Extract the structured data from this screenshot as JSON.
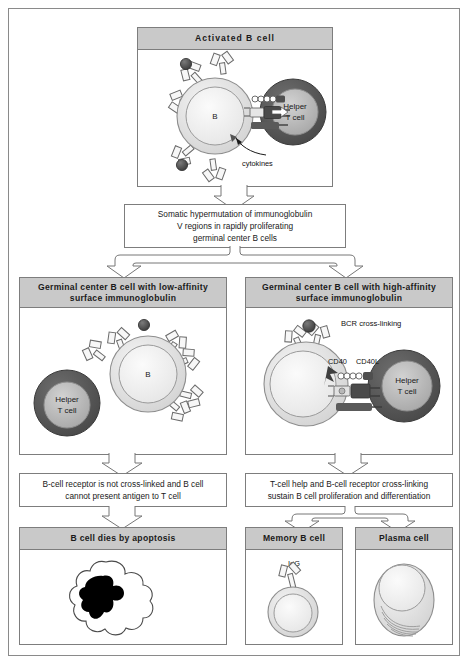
{
  "figure": {
    "colors": {
      "header_fill": "#c9c9c9",
      "border": "#7d7d7d",
      "bcell_fill": "#d8d8d8",
      "bcell_nucleus": "#ececec",
      "tcell_rim": "#5a5a5a",
      "tcell_nucleus": "#b4b4b4",
      "antigen": "#4a4a4a",
      "background": "#ffffff"
    }
  },
  "top_panel": {
    "header": "Activated B cell",
    "bcell_label": "B",
    "tcell_label_line1": "Helper",
    "tcell_label_line2": "T cell",
    "cytokines_label": "cytokines"
  },
  "middle_box": {
    "line1": "Somatic hypermutation of immunoglobulin",
    "line2": "V regions in rapidly proliferating",
    "line3": "germinal center B cells"
  },
  "left_branch": {
    "header_line1": "Germinal center B cell with low-affinity",
    "header_line2": "surface immunoglobulin",
    "bcell_label": "B",
    "tcell_label_line1": "Helper",
    "tcell_label_line2": "T cell",
    "outcome_line1": "B-cell receptor is not cross-linked and B cell",
    "outcome_line2": "cannot present antigen to T cell",
    "result_header": "B cell dies by apoptosis"
  },
  "right_branch": {
    "header_line1": "Germinal center B cell with high-affinity",
    "header_line2": "surface immunoglobulin",
    "bcr_label": "BCR cross-linking",
    "cd40_label": "CD40",
    "cd40l_label": "CD40L",
    "tcell_label_line1": "Helper",
    "tcell_label_line2": "T cell",
    "outcome_line1": "T-cell help and B-cell receptor cross-linking",
    "outcome_line2": "sustain B cell proliferation and differentiation",
    "memory_header": "Memory B cell",
    "memory_igg_label": "IgG",
    "plasma_header": "Plasma cell"
  }
}
